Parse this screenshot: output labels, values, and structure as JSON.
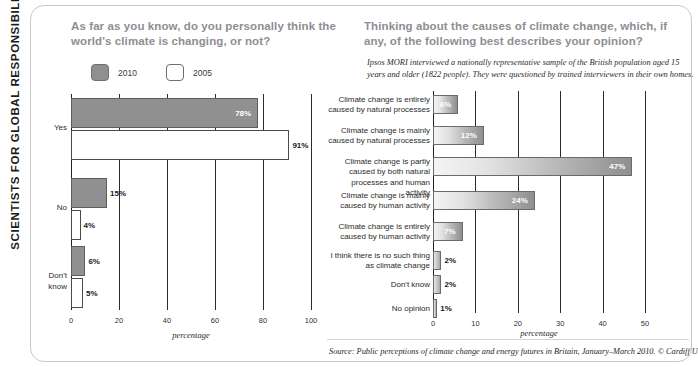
{
  "banner": {
    "text": "SCIENTISTS FOR GLOBAL RESPONSIBILITY"
  },
  "left_panel": {
    "title": "As far as you know, do you personally think the world's climate is changing, or not?",
    "legend": [
      {
        "label": "2010",
        "style": "filled",
        "color": "#909090"
      },
      {
        "label": "2005",
        "style": "hollow",
        "color": "#ffffff"
      }
    ]
  },
  "right_panel": {
    "title": "Thinking about the causes of climate change, which, if any, of the following best describes your opinion?",
    "note": "Ipsos MORI interviewed a nationally representative sample of the British population aged 15 years and older (1822 people). They were questioned by trained interviewers in their own homes.",
    "source": "Source: Public perceptions of climate change and energy futures in Britain, January–March 2010. © Cardiff University"
  },
  "chart_data": [
    {
      "id": "climate-changing",
      "type": "bar",
      "orientation": "horizontal",
      "title": "As far as you know, do you personally think the world's climate is changing, or not?",
      "xlabel": "percentage",
      "ylabel": "",
      "xlim": [
        0,
        100
      ],
      "xticks": [
        0,
        20,
        40,
        60,
        80,
        100
      ],
      "grid": true,
      "legend_position": "top-left",
      "categories": [
        "Yes",
        "No",
        "Don't know"
      ],
      "series": [
        {
          "name": "2010",
          "color": "#909090",
          "values": [
            78,
            15,
            6
          ],
          "labels": [
            "78%",
            "15%",
            "6%"
          ]
        },
        {
          "name": "2005",
          "color": "#ffffff",
          "values": [
            91,
            4,
            5
          ],
          "labels": [
            "91%",
            "4%",
            "5%"
          ]
        }
      ]
    },
    {
      "id": "causes-of-climate-change",
      "type": "bar",
      "orientation": "horizontal",
      "title": "Thinking about the causes of climate change, which, if any, of the following best describes your opinion?",
      "xlabel": "percentage",
      "ylabel": "",
      "xlim": [
        0,
        50
      ],
      "xticks": [
        0,
        10,
        20,
        30,
        40,
        50
      ],
      "grid": true,
      "legend_position": "none",
      "categories": [
        "Climate change is entirely caused by natural processes",
        "Climate change is mainly caused by natural processes",
        "Climate change is partly caused by both natural processes and human activity",
        "Climate change is mainly caused by human activity",
        "Climate change is entirely caused by human activity",
        "I think there is no such thing as climate change",
        "Don't know",
        "No opinion"
      ],
      "values": [
        6,
        12,
        47,
        24,
        7,
        2,
        2,
        1
      ],
      "labels": [
        "6%",
        "12%",
        "47%",
        "24%",
        "7%",
        "2%",
        "2%",
        "1%"
      ]
    }
  ]
}
